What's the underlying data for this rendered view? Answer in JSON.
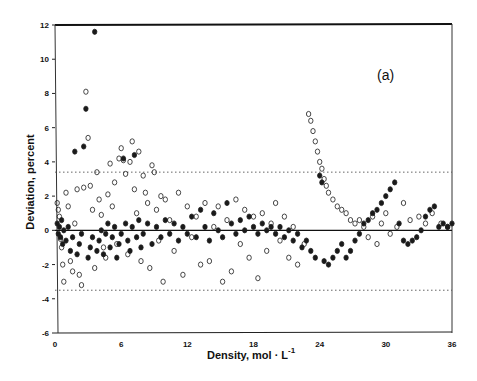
{
  "chart_data": {
    "type": "scatter",
    "title": "",
    "panel_label": "(a)",
    "xlabel": "Density, mol · L",
    "xlabel_superscript": "-1",
    "ylabel": "Deviation, percent",
    "xlim": [
      0,
      36
    ],
    "ylim": [
      -6,
      12
    ],
    "xticks": [
      0,
      6,
      12,
      18,
      24,
      30,
      36
    ],
    "yticks": [
      -6,
      -4,
      -2,
      0,
      2,
      4,
      6,
      8,
      10,
      12
    ],
    "grid": false,
    "legend": null,
    "reference_lines": [
      {
        "y": 0,
        "style": "solid"
      },
      {
        "y": 3.4,
        "style": "dotted"
      },
      {
        "y": -3.5,
        "style": "dotted"
      }
    ],
    "series": [
      {
        "name": "open-circles",
        "marker": "open-circle",
        "points": [
          [
            0.2,
            1.6
          ],
          [
            0.3,
            1.2
          ],
          [
            0.4,
            0.8
          ],
          [
            0.5,
            -0.5
          ],
          [
            0.6,
            -1.0
          ],
          [
            0.7,
            -2.0
          ],
          [
            0.8,
            -3.0
          ],
          [
            1.0,
            2.2
          ],
          [
            1.2,
            1.4
          ],
          [
            1.4,
            -1.8
          ],
          [
            1.6,
            -2.4
          ],
          [
            1.8,
            0.4
          ],
          [
            2.0,
            2.4
          ],
          [
            2.2,
            -2.6
          ],
          [
            2.4,
            -3.2
          ],
          [
            2.6,
            2.5
          ],
          [
            2.8,
            8.1
          ],
          [
            3.0,
            5.4
          ],
          [
            3.2,
            2.6
          ],
          [
            3.4,
            1.2
          ],
          [
            3.6,
            -2.2
          ],
          [
            3.8,
            3.4
          ],
          [
            4.0,
            1.8
          ],
          [
            4.2,
            0.9
          ],
          [
            4.4,
            -1.0
          ],
          [
            4.6,
            -1.6
          ],
          [
            4.8,
            2.1
          ],
          [
            5.0,
            3.9
          ],
          [
            5.2,
            1.4
          ],
          [
            5.4,
            2.8
          ],
          [
            5.6,
            -0.8
          ],
          [
            5.8,
            4.2
          ],
          [
            6.0,
            4.8
          ],
          [
            6.2,
            4.1
          ],
          [
            6.4,
            3.3
          ],
          [
            6.6,
            -1.4
          ],
          [
            6.8,
            4.0
          ],
          [
            7.0,
            5.2
          ],
          [
            7.2,
            2.4
          ],
          [
            7.4,
            1.0
          ],
          [
            7.6,
            4.6
          ],
          [
            7.8,
            -1.8
          ],
          [
            8.0,
            3.2
          ],
          [
            8.2,
            2.2
          ],
          [
            8.4,
            1.6
          ],
          [
            8.6,
            -2.2
          ],
          [
            8.8,
            3.8
          ],
          [
            9.0,
            3.4
          ],
          [
            9.2,
            1.2
          ],
          [
            9.4,
            -0.6
          ],
          [
            9.6,
            2.0
          ],
          [
            9.8,
            -3.0
          ],
          [
            10.0,
            1.8
          ],
          [
            10.4,
            0.6
          ],
          [
            10.8,
            -1.2
          ],
          [
            11.2,
            2.2
          ],
          [
            11.6,
            -2.6
          ],
          [
            12.0,
            1.4
          ],
          [
            12.4,
            -0.4
          ],
          [
            12.8,
            0.8
          ],
          [
            13.2,
            -2.0
          ],
          [
            13.6,
            1.6
          ],
          [
            14.0,
            -1.8
          ],
          [
            14.4,
            0.2
          ],
          [
            14.8,
            1.4
          ],
          [
            15.2,
            -3.0
          ],
          [
            15.6,
            0.6
          ],
          [
            16.0,
            -2.4
          ],
          [
            16.4,
            1.8
          ],
          [
            16.8,
            -0.8
          ],
          [
            17.2,
            1.2
          ],
          [
            17.6,
            -1.6
          ],
          [
            18.0,
            0.8
          ],
          [
            18.4,
            -2.8
          ],
          [
            18.8,
            1.0
          ],
          [
            19.2,
            -1.2
          ],
          [
            19.6,
            0.4
          ],
          [
            20.0,
            1.6
          ],
          [
            20.4,
            -0.6
          ],
          [
            20.8,
            0.8
          ],
          [
            21.2,
            -1.6
          ],
          [
            21.6,
            0.2
          ],
          [
            22.0,
            -2.0
          ],
          [
            22.6,
            -0.8
          ],
          [
            23.0,
            6.8
          ],
          [
            23.2,
            6.4
          ],
          [
            23.4,
            5.8
          ],
          [
            23.6,
            5.2
          ],
          [
            23.8,
            4.6
          ],
          [
            24.0,
            4.0
          ],
          [
            24.2,
            3.6
          ],
          [
            24.4,
            3.0
          ],
          [
            24.6,
            2.6
          ],
          [
            24.8,
            2.2
          ],
          [
            25.2,
            1.8
          ],
          [
            25.6,
            1.4
          ],
          [
            26.0,
            1.2
          ],
          [
            26.4,
            1.0
          ],
          [
            26.8,
            0.6
          ],
          [
            27.2,
            0.4
          ],
          [
            27.6,
            0.6
          ],
          [
            28.0,
            0.2
          ],
          [
            28.4,
            -0.4
          ],
          [
            28.8,
            0.8
          ],
          [
            29.2,
            -0.8
          ],
          [
            29.6,
            0.4
          ],
          [
            30.0,
            1.0
          ],
          [
            30.4,
            -0.2
          ],
          [
            31.0,
            0.2
          ],
          [
            31.6,
            1.6
          ],
          [
            32.2,
            0.6
          ],
          [
            33.0,
            0.8
          ],
          [
            33.6,
            0.4
          ],
          [
            34.2,
            1.0
          ],
          [
            35.0,
            0.4
          ],
          [
            35.6,
            0.2
          ]
        ]
      },
      {
        "name": "filled-circles",
        "marker": "filled-circle",
        "points": [
          [
            0.2,
            0.4
          ],
          [
            0.3,
            -0.2
          ],
          [
            0.4,
            0.2
          ],
          [
            0.5,
            -0.4
          ],
          [
            0.6,
            0.6
          ],
          [
            0.7,
            -0.8
          ],
          [
            0.8,
            0.0
          ],
          [
            1.0,
            -0.6
          ],
          [
            1.2,
            0.2
          ],
          [
            1.4,
            -1.2
          ],
          [
            1.6,
            -0.4
          ],
          [
            1.8,
            4.6
          ],
          [
            2.0,
            -1.4
          ],
          [
            2.2,
            -0.8
          ],
          [
            2.4,
            -0.2
          ],
          [
            2.6,
            4.9
          ],
          [
            2.8,
            7.1
          ],
          [
            3.0,
            -1.6
          ],
          [
            3.2,
            -1.0
          ],
          [
            3.4,
            -0.4
          ],
          [
            3.6,
            11.6
          ],
          [
            3.8,
            -1.2
          ],
          [
            4.0,
            -0.6
          ],
          [
            4.2,
            0.0
          ],
          [
            4.4,
            -1.4
          ],
          [
            4.6,
            -0.2
          ],
          [
            4.8,
            0.4
          ],
          [
            5.0,
            -1.0
          ],
          [
            5.2,
            -0.4
          ],
          [
            5.4,
            0.2
          ],
          [
            5.6,
            -1.6
          ],
          [
            5.8,
            -0.8
          ],
          [
            6.0,
            -0.2
          ],
          [
            6.2,
            4.2
          ],
          [
            6.4,
            0.4
          ],
          [
            6.6,
            -0.6
          ],
          [
            6.8,
            -1.2
          ],
          [
            7.0,
            0.2
          ],
          [
            7.2,
            4.4
          ],
          [
            7.4,
            -0.4
          ],
          [
            7.6,
            0.6
          ],
          [
            7.8,
            -1.0
          ],
          [
            8.0,
            -0.2
          ],
          [
            8.4,
            0.4
          ],
          [
            8.8,
            -0.8
          ],
          [
            9.2,
            0.2
          ],
          [
            9.6,
            -0.4
          ],
          [
            10.0,
            0.6
          ],
          [
            10.4,
            -0.2
          ],
          [
            10.8,
            0.4
          ],
          [
            11.2,
            -0.6
          ],
          [
            11.6,
            0.2
          ],
          [
            12.0,
            -0.2
          ],
          [
            12.4,
            0.8
          ],
          [
            12.8,
            -0.4
          ],
          [
            13.2,
            1.2
          ],
          [
            13.6,
            0.2
          ],
          [
            14.0,
            -0.6
          ],
          [
            14.4,
            1.0
          ],
          [
            14.8,
            0.0
          ],
          [
            15.2,
            -0.4
          ],
          [
            15.6,
            1.6
          ],
          [
            16.0,
            0.4
          ],
          [
            16.4,
            -0.2
          ],
          [
            16.8,
            0.6
          ],
          [
            17.2,
            0.0
          ],
          [
            17.6,
            0.8
          ],
          [
            18.0,
            0.2
          ],
          [
            18.4,
            -0.2
          ],
          [
            18.8,
            0.4
          ],
          [
            19.2,
            0.0
          ],
          [
            19.6,
            0.2
          ],
          [
            20.0,
            -0.2
          ],
          [
            20.4,
            0.2
          ],
          [
            20.8,
            -0.4
          ],
          [
            21.2,
            0.0
          ],
          [
            21.6,
            -0.6
          ],
          [
            22.0,
            -0.2
          ],
          [
            22.4,
            -1.0
          ],
          [
            22.8,
            -0.6
          ],
          [
            23.2,
            -1.2
          ],
          [
            23.6,
            -1.6
          ],
          [
            24.0,
            3.2
          ],
          [
            24.2,
            2.8
          ],
          [
            24.4,
            -1.8
          ],
          [
            24.8,
            -2.0
          ],
          [
            25.2,
            -1.6
          ],
          [
            25.6,
            -1.2
          ],
          [
            26.0,
            -0.8
          ],
          [
            26.4,
            -1.6
          ],
          [
            26.8,
            -1.2
          ],
          [
            27.2,
            -0.6
          ],
          [
            27.6,
            -0.2
          ],
          [
            28.0,
            0.4
          ],
          [
            28.4,
            0.6
          ],
          [
            28.8,
            1.0
          ],
          [
            29.2,
            1.2
          ],
          [
            29.6,
            1.6
          ],
          [
            30.0,
            2.0
          ],
          [
            30.4,
            2.4
          ],
          [
            30.8,
            2.8
          ],
          [
            31.2,
            0.4
          ],
          [
            31.6,
            -0.6
          ],
          [
            32.0,
            -0.8
          ],
          [
            32.4,
            -0.6
          ],
          [
            32.8,
            -0.4
          ],
          [
            33.2,
            0.0
          ],
          [
            33.6,
            0.8
          ],
          [
            34.0,
            1.2
          ],
          [
            34.4,
            1.4
          ],
          [
            34.8,
            0.2
          ],
          [
            35.2,
            0.4
          ],
          [
            35.6,
            0.2
          ],
          [
            36.0,
            0.4
          ]
        ]
      }
    ]
  }
}
